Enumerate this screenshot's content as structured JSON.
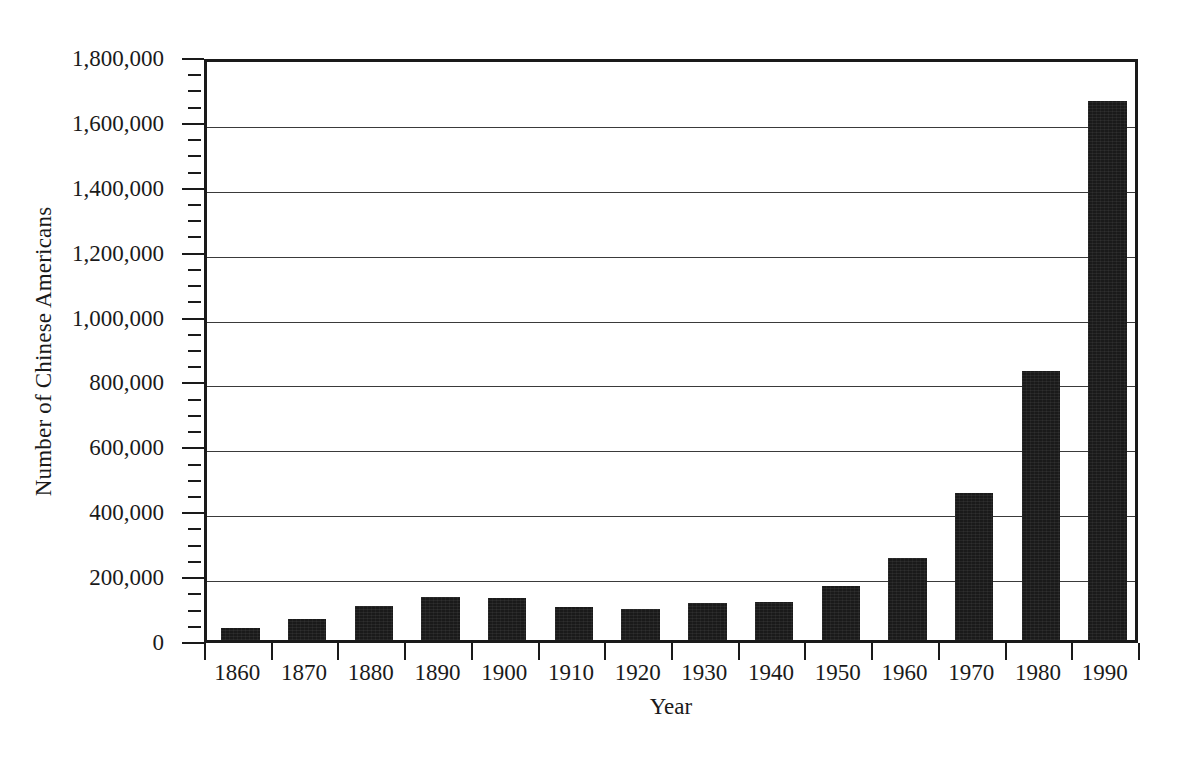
{
  "chart_data": {
    "type": "bar",
    "title": "",
    "xlabel": "Year",
    "ylabel": "Number of Chinese Americans",
    "categories": [
      "1860",
      "1870",
      "1880",
      "1890",
      "1900",
      "1910",
      "1920",
      "1930",
      "1940",
      "1950",
      "1960",
      "1970",
      "1980",
      "1990"
    ],
    "values": [
      38000,
      64000,
      106000,
      134000,
      128000,
      102000,
      95000,
      113000,
      117000,
      165000,
      252000,
      453000,
      830000,
      1660000
    ],
    "ylim": [
      0,
      1800000
    ],
    "ytick_values": [
      0,
      200000,
      400000,
      600000,
      800000,
      1000000,
      1200000,
      1400000,
      1600000,
      1800000
    ],
    "ytick_labels": [
      "0",
      "200,000",
      "400,000",
      "600,000",
      "800,000",
      "1,000,000",
      "1,200,000",
      "1,400,000",
      "1,600,000",
      "1,800,000"
    ],
    "yminor_step": 50000,
    "grid": true,
    "grid_axis": "y",
    "legend": false,
    "bar_color": "#1a1a1a",
    "axis_color": "#1a1a1a",
    "background_color": "#ffffff"
  }
}
